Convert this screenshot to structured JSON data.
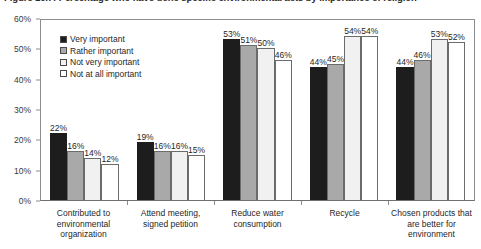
{
  "chart_data": {
    "type": "bar",
    "title": "Figure 10.7: Percentage who have done specific environmental acts by importance of religion",
    "xlabel": "",
    "ylabel": "",
    "ylim": [
      0,
      60
    ],
    "ytick_labels": [
      "0%",
      "10%",
      "20%",
      "30%",
      "40%",
      "50%",
      "60%"
    ],
    "ytick_values": [
      0,
      10,
      20,
      30,
      40,
      50,
      60
    ],
    "grid": false,
    "legend_position": "top-left",
    "categories": [
      "Contributed to environmental organization",
      "Attend meeting, signed petition",
      "Reduce water consumption",
      "Recycle",
      "Chosen products that are better for environment"
    ],
    "series": [
      {
        "name": "Very important",
        "values": [
          22,
          19,
          53,
          44,
          44
        ],
        "labels": [
          "22%",
          "19%",
          "53%",
          "44%",
          "44%"
        ],
        "color": "#1d1d1d"
      },
      {
        "name": "Rather important",
        "values": [
          16,
          16,
          51,
          45,
          46
        ],
        "labels": [
          "16%",
          "16%",
          "51%",
          "45%",
          "46%"
        ],
        "color": "#a9a9a9"
      },
      {
        "name": "Not very important",
        "values": [
          14,
          16,
          50,
          54,
          53
        ],
        "labels": [
          "14%",
          "16%",
          "50%",
          "54%",
          "53%"
        ],
        "color": "#f1f1f1"
      },
      {
        "name": "Not at all important",
        "values": [
          12,
          15,
          46,
          54,
          52
        ],
        "labels": [
          "12%",
          "15%",
          "46%",
          "54%",
          "52%"
        ],
        "color": "#ffffff"
      }
    ]
  }
}
